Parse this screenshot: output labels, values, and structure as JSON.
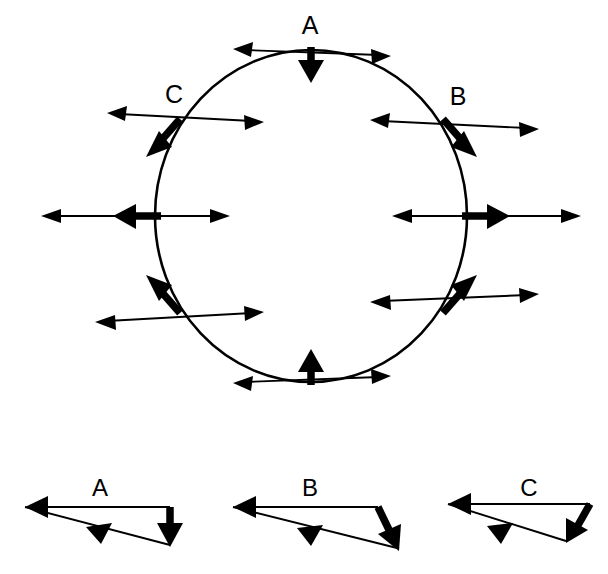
{
  "figure": {
    "title": "",
    "background_color": "#ffffff",
    "ink_color": "#000000",
    "main": {
      "shape": "circle",
      "center": {
        "x": 311,
        "y": 216
      },
      "radius_x": 156,
      "radius_y": 166,
      "labels": [
        {
          "id": "A",
          "text": "A",
          "x": 310,
          "y": 34
        },
        {
          "id": "B",
          "text": "B",
          "x": 458,
          "y": 101
        },
        {
          "id": "C",
          "text": "C",
          "x": 174,
          "y": 99
        }
      ],
      "stations": [
        {
          "id": "top",
          "angle_deg": 90,
          "label": "A",
          "thin_arrow": "double-headed-horizontal",
          "thick_arrow": "down"
        },
        {
          "id": "upper-right",
          "angle_deg": 45,
          "label": "B",
          "thin_arrow": "double-headed-horizontal",
          "thick_arrow": "down-right"
        },
        {
          "id": "right",
          "angle_deg": 0,
          "label": "",
          "thin_arrow": "double-headed-horizontal",
          "thick_arrow": "right"
        },
        {
          "id": "lower-right",
          "angle_deg": -45,
          "label": "",
          "thin_arrow": "double-headed-horizontal",
          "thick_arrow": "up-right"
        },
        {
          "id": "bottom",
          "angle_deg": -90,
          "label": "",
          "thin_arrow": "double-headed-horizontal",
          "thick_arrow": "up"
        },
        {
          "id": "lower-left",
          "angle_deg": 225,
          "label": "",
          "thin_arrow": "double-headed-horizontal",
          "thick_arrow": "up-left"
        },
        {
          "id": "left",
          "angle_deg": 180,
          "label": "",
          "thin_arrow": "double-headed-horizontal",
          "thick_arrow": "left"
        },
        {
          "id": "upper-left",
          "angle_deg": 135,
          "label": "C",
          "thin_arrow": "double-headed-horizontal",
          "thick_arrow": "down-left"
        }
      ]
    },
    "insets": [
      {
        "id": "A",
        "label": "A",
        "label_x": 100,
        "label_y": 488,
        "description": "vector triangle: thin arrow pointing left along top, thin arrow pointing down-right along hypotenuse, thick arrow pointing down on right side",
        "vectors": [
          {
            "name": "top-thin-left",
            "weight": "thin",
            "from": {
              "x": 170,
              "y": 507
            },
            "to": {
              "x": 25,
              "y": 507
            }
          },
          {
            "name": "hypotenuse-thin",
            "weight": "thin",
            "from": {
              "x": 25,
              "y": 507
            },
            "to": {
              "x": 170,
              "y": 545
            }
          },
          {
            "name": "right-thick-down",
            "weight": "thick",
            "from": {
              "x": 170,
              "y": 507
            },
            "to": {
              "x": 170,
              "y": 545
            }
          }
        ]
      },
      {
        "id": "B",
        "label": "B",
        "label_x": 310,
        "label_y": 488,
        "description": "vector triangle: thin arrow pointing left along top, thin arrow pointing down-right along hypotenuse, thick arrow pointing down-right on right side",
        "vectors": [
          {
            "name": "top-thin-left",
            "weight": "thin",
            "from": {
              "x": 163,
              "y": 507
            },
            "to": {
              "x": 18,
              "y": 507
            }
          },
          {
            "name": "hypotenuse-thin",
            "weight": "thin",
            "from": {
              "x": 18,
              "y": 507
            },
            "to": {
              "x": 182,
              "y": 548
            }
          },
          {
            "name": "right-thick-downright",
            "weight": "thick",
            "from": {
              "x": 163,
              "y": 507
            },
            "to": {
              "x": 182,
              "y": 548
            }
          }
        ]
      },
      {
        "id": "C",
        "label": "C",
        "label_x": 529,
        "label_y": 488,
        "description": "vector triangle: thin arrow pointing left along top, thin arrow pointing down-right along hypotenuse, thick arrow pointing down-left",
        "vectors": [
          {
            "name": "top-thin-left",
            "weight": "thin",
            "from": {
              "x": 170,
              "y": 504
            },
            "to": {
              "x": 28,
              "y": 504
            }
          },
          {
            "name": "hypotenuse-thin",
            "weight": "thin",
            "from": {
              "x": 28,
              "y": 504
            },
            "to": {
              "x": 146,
              "y": 541
            }
          },
          {
            "name": "right-thick-downleft",
            "weight": "thick",
            "from": {
              "x": 170,
              "y": 504
            },
            "to": {
              "x": 146,
              "y": 541
            }
          }
        ]
      }
    ],
    "inset_origins": [
      {
        "id": "A",
        "x": 0
      },
      {
        "id": "B",
        "x": 215
      },
      {
        "id": "C",
        "x": 420
      }
    ]
  }
}
